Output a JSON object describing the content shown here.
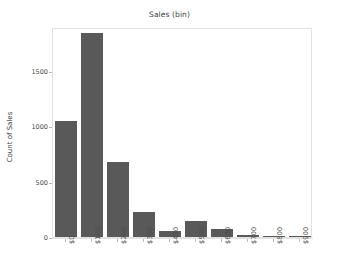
{
  "chart_data": {
    "type": "bar",
    "title": "Sales (bin)",
    "xlabel": "",
    "ylabel": "Count of Sales",
    "categories": [
      "$0",
      "$100",
      "$200",
      "$300",
      "$400",
      "$500",
      "$600",
      "$700",
      "$800",
      "$900"
    ],
    "values": [
      1050,
      1845,
      680,
      230,
      55,
      145,
      75,
      15,
      3,
      3
    ],
    "ylim": [
      0,
      1900
    ],
    "yticks": [
      0,
      500,
      1000,
      1500
    ],
    "ytick_labels": [
      "0",
      "500",
      "1000",
      "1500"
    ],
    "grid": false,
    "legend": null,
    "bar_color": "#595959",
    "axis_color": "#e2e2e2",
    "background": "#ffffff"
  }
}
